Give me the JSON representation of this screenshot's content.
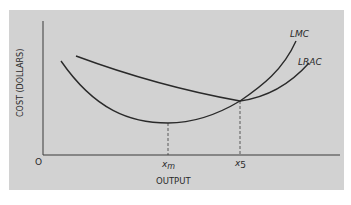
{
  "diagram": {
    "type": "economics-cost-curves",
    "y_axis_label": "COST (DOLLARS)",
    "x_axis_label": "OUTPUT",
    "origin_label": "O",
    "curves": [
      {
        "name": "LMC",
        "label": "LMC",
        "description": "Long-run marginal cost, U-shaped, minimum at x_m, rises steeply"
      },
      {
        "name": "LRAC",
        "label": "LRAC",
        "description": "Long-run average cost, U-shaped, minimum at x_5 where LMC crosses it"
      }
    ],
    "x_ticks": [
      {
        "label_main": "x",
        "label_sub": "m",
        "meaning": "output at LMC minimum"
      },
      {
        "label_main": "x",
        "label_sub": "5",
        "meaning": "output at LRAC minimum (LMC = LRAC)"
      }
    ],
    "colors": {
      "background": "#d2d2d2",
      "line": "#2a2a2a"
    }
  }
}
